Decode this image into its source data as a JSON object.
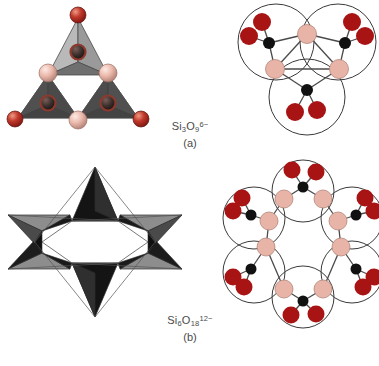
{
  "figure": {
    "background_color": "#ffffff"
  },
  "panels": [
    {
      "id": "a",
      "sublabel": "(a)",
      "formula_text": "Si3O9 6-",
      "formula": {
        "element1": "Si",
        "sub1": "3",
        "element2": "O",
        "sub2": "9",
        "charge": "6−"
      },
      "ring_size": 3,
      "description": "three corner-sharing SiO4 tetrahedra forming a cyclic trisilicate ring",
      "polyhedral_view": {
        "tetrahedra_count": 3,
        "apex_oxygen_count": 3,
        "bridging_oxygen_count": 3
      },
      "ball_and_stick_view": {
        "circles_count": 3,
        "silicon_count": 3,
        "bridging_oxygen_count": 3,
        "terminal_oxygen_count": 6
      }
    },
    {
      "id": "b",
      "sublabel": "(b)",
      "formula_text": "Si6O18 12-",
      "formula": {
        "element1": "Si",
        "sub1": "6",
        "element2": "O",
        "sub2": "18",
        "charge": "12−"
      },
      "ring_size": 6,
      "description": "six corner-sharing SiO4 tetrahedra forming a six-membered ring, drawn as a six-pointed star",
      "polyhedral_view": {
        "tetrahedra_count": 6,
        "star_points": 6
      },
      "ball_and_stick_view": {
        "circles_count": 6,
        "silicon_count": 6,
        "bridging_oxygen_count": 6,
        "terminal_oxygen_count": 12
      }
    }
  ],
  "colors": {
    "oxygen_terminal": "#a81414",
    "oxygen_terminal_highlight": "#d84a3a",
    "oxygen_bridging": "#e8b4a8",
    "oxygen_bridging_highlight": "#f6dcd4",
    "silicon": "#111111",
    "tetra_face_light": "#b8b8b8",
    "tetra_face_mid": "#7d7d7d",
    "tetra_face_dark": "#2b2b2b",
    "tetra_face_black": "#141414",
    "outline": "#3a3a3a",
    "bond": "#4a4a4a",
    "caption_text": "#4a4a4a"
  }
}
